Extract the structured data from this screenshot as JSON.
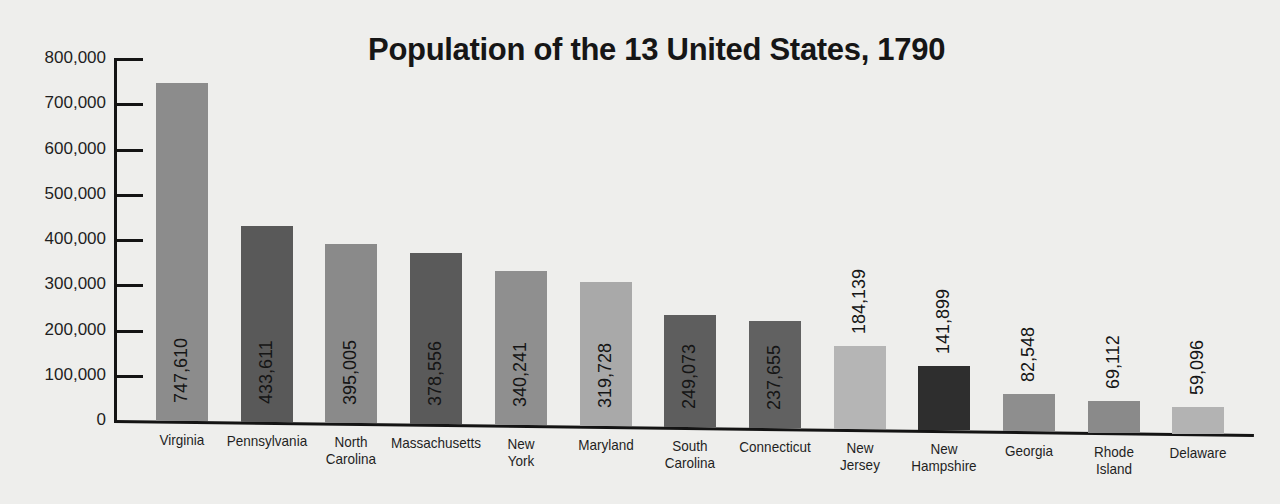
{
  "chart_data": {
    "type": "bar",
    "title": "Population of the 13 United States, 1790",
    "xlabel": "",
    "ylabel": "",
    "ylim": [
      0,
      800000
    ],
    "yticks": [
      0,
      100000,
      200000,
      300000,
      400000,
      500000,
      600000,
      700000,
      800000
    ],
    "ytick_labels": [
      "0",
      "100,000",
      "200,000",
      "300,000",
      "400,000",
      "500,000",
      "600,000",
      "700,000",
      "800,000"
    ],
    "grid": false,
    "legend": null,
    "categories": [
      "Virginia",
      "Pennsylvania",
      "North Carolina",
      "Massachusetts",
      "New York",
      "Maryland",
      "South Carolina",
      "Connecticut",
      "New Jersey",
      "New Hampshire",
      "Georgia",
      "Rhode Island",
      "Delaware"
    ],
    "category_labels": [
      [
        "Virginia"
      ],
      [
        "Pennsylvania"
      ],
      [
        "North",
        "Carolina"
      ],
      [
        "Massachusetts"
      ],
      [
        "New",
        "York"
      ],
      [
        "Maryland"
      ],
      [
        "South",
        "Carolina"
      ],
      [
        "Connecticut"
      ],
      [
        "New",
        "Jersey"
      ],
      [
        "New",
        "Hampshire"
      ],
      [
        "Georgia"
      ],
      [
        "Rhode",
        "Island"
      ],
      [
        "Delaware"
      ]
    ],
    "values": [
      747610,
      433611,
      395005,
      378556,
      340241,
      319728,
      249073,
      237655,
      184139,
      141899,
      82548,
      69112,
      59096
    ],
    "value_labels": [
      "747,610",
      "433,611",
      "395,005",
      "378,556",
      "340,241",
      "319,728",
      "249,073",
      "237,655",
      "184,139",
      "141,899",
      "82,548",
      "69,112",
      "59,096"
    ],
    "label_inside": [
      true,
      true,
      true,
      true,
      true,
      true,
      true,
      true,
      false,
      false,
      false,
      false,
      false
    ],
    "bar_colors": [
      "#8c8c8c",
      "#595959",
      "#8a8a8a",
      "#5a5a5a",
      "#8f8f8f",
      "#a9a9a9",
      "#5e5e5e",
      "#616161",
      "#b5b5b5",
      "#2e2e2e",
      "#8e8e8e",
      "#8a8a8a",
      "#b3b3b3"
    ]
  }
}
